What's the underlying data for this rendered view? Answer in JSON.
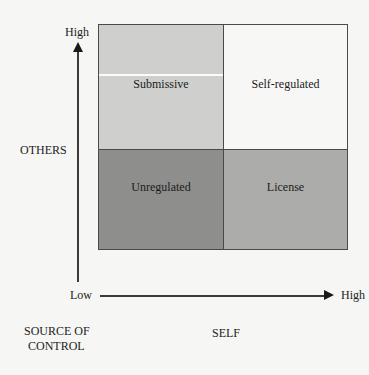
{
  "diagram": {
    "type": "2x2 matrix",
    "quadrants": [
      {
        "position": "top-left",
        "label": "Submissive",
        "color": "#cfcfcd"
      },
      {
        "position": "top-right",
        "label": "Self-regulated",
        "color": "#f7f7f5"
      },
      {
        "position": "bottom-left",
        "label": "Unregulated",
        "color": "#8e8e8c"
      },
      {
        "position": "bottom-right",
        "label": "License",
        "color": "#acacaa"
      }
    ],
    "y_axis": {
      "title": "OTHERS",
      "high_label": "High",
      "low_label": "Low"
    },
    "x_axis": {
      "title": "SELF",
      "high_label": "High"
    },
    "corner_title_line1": "SOURCE OF",
    "corner_title_line2": "CONTROL"
  }
}
